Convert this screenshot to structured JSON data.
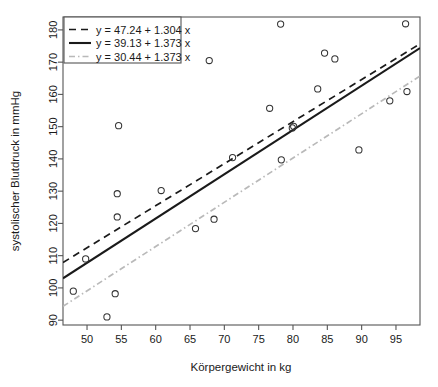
{
  "chart_data": {
    "type": "scatter",
    "title": "",
    "xlabel": "Körpergewicht in kg",
    "ylabel": "systolischer Blutdruck in mmHg",
    "xlim": [
      46.5,
      98.5
    ],
    "ylim": [
      88.5,
      184.0
    ],
    "xticks": [
      50,
      55,
      60,
      65,
      70,
      75,
      80,
      85,
      90,
      95
    ],
    "yticks": [
      90,
      100,
      110,
      120,
      130,
      140,
      150,
      160,
      170,
      180
    ],
    "xtick_labels": [
      "50",
      "55",
      "60",
      "65",
      "70",
      "75",
      "80",
      "85",
      "90",
      "95"
    ],
    "ytick_labels": [
      "90",
      "100",
      "110",
      "120",
      "130",
      "140",
      "150",
      "160",
      "170",
      "180"
    ],
    "grid": false,
    "legend_position": "top-left",
    "points": [
      {
        "x": 48.0,
        "y": 99.0
      },
      {
        "x": 49.8,
        "y": 109.0
      },
      {
        "x": 52.9,
        "y": 91.0
      },
      {
        "x": 54.1,
        "y": 98.2
      },
      {
        "x": 54.4,
        "y": 122.0
      },
      {
        "x": 54.4,
        "y": 129.2
      },
      {
        "x": 54.6,
        "y": 150.3
      },
      {
        "x": 60.8,
        "y": 130.2
      },
      {
        "x": 65.8,
        "y": 118.4
      },
      {
        "x": 67.8,
        "y": 170.5
      },
      {
        "x": 68.5,
        "y": 121.3
      },
      {
        "x": 71.2,
        "y": 140.4
      },
      {
        "x": 76.6,
        "y": 155.7
      },
      {
        "x": 78.2,
        "y": 181.8
      },
      {
        "x": 78.3,
        "y": 139.7
      },
      {
        "x": 79.9,
        "y": 149.6
      },
      {
        "x": 80.1,
        "y": 150.1
      },
      {
        "x": 83.6,
        "y": 161.7
      },
      {
        "x": 84.6,
        "y": 172.8
      },
      {
        "x": 86.1,
        "y": 171.0
      },
      {
        "x": 89.6,
        "y": 142.8
      },
      {
        "x": 94.1,
        "y": 158.0
      },
      {
        "x": 96.4,
        "y": 181.9
      },
      {
        "x": 96.6,
        "y": 160.9
      }
    ],
    "series": [
      {
        "name": "y = 47.24 + 1.304 x",
        "type": "line",
        "intercept": 47.24,
        "slope": 1.304,
        "style": "dashed",
        "color": "#1a1a1a"
      },
      {
        "name": "y = 39.13 + 1.373 x",
        "type": "line",
        "intercept": 39.13,
        "slope": 1.373,
        "style": "solid",
        "color": "#1a1a1a"
      },
      {
        "name": "y = 30.44 + 1.373 x",
        "type": "line",
        "intercept": 30.44,
        "slope": 1.373,
        "style": "dashdot",
        "color": "#b9b9b9"
      }
    ],
    "legend_entries": [
      "y = 47.24 + 1.304 x",
      "y = 39.13 + 1.373 x",
      "y = 30.44 + 1.373 x"
    ]
  },
  "plot_geometry": {
    "left": 63,
    "right": 420,
    "top": 17,
    "bottom": 325
  },
  "legend_geometry": {
    "x": 64,
    "y": 17,
    "width": 117,
    "height": 46
  }
}
